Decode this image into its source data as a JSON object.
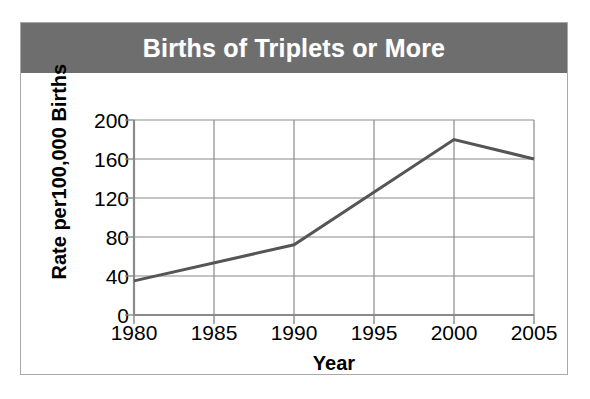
{
  "figure": {
    "title": "Births of Triplets or More",
    "title_band_color": "#6e6e6e",
    "title_text_color": "#ffffff",
    "frame_border_color": "#a9a9a9",
    "background_color": "#ffffff"
  },
  "chart_data": {
    "type": "line",
    "title": "Births of Triplets or More",
    "xlabel": "Year",
    "ylabel": "Rate per100,000 Births",
    "x": [
      1980,
      1990,
      2000,
      2005
    ],
    "values": [
      35,
      72,
      180,
      160
    ],
    "series": [
      {
        "name": "Rate of births of triplets or more",
        "x": [
          1980,
          1990,
          2000,
          2005
        ],
        "values": [
          35,
          72,
          180,
          160
        ],
        "color": "#555555",
        "line_width": 3
      }
    ],
    "xlim": [
      1980,
      2005
    ],
    "ylim": [
      0,
      200
    ],
    "xticks": [
      1980,
      1985,
      1990,
      1995,
      2000,
      2005
    ],
    "yticks": [
      0,
      40,
      80,
      120,
      160,
      200
    ],
    "xtick_labels": [
      "1980",
      "1985",
      "1990",
      "1995",
      "2000",
      "2005"
    ],
    "ytick_labels": [
      "0",
      "40",
      "80",
      "120",
      "160",
      "200"
    ],
    "grid": true,
    "grid_color": "#8a8a8a",
    "legend": false,
    "legend_position": "none"
  }
}
